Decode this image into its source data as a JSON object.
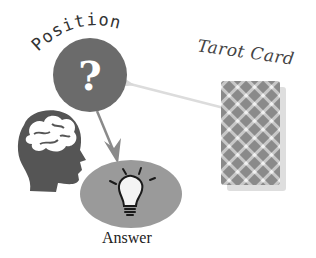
{
  "diagram": {
    "position_label": "Position",
    "position_symbol": "?",
    "tarot_label": "Tarot Card",
    "answer_label": "Answer",
    "icons": {
      "position": "question-circle-icon",
      "mind": "brain-head-icon",
      "answer": "lightbulb-icon",
      "card": "tarot-card-icon"
    },
    "colors": {
      "circle": "#6b6b6b",
      "ellipse": "#9a9a9a",
      "head": "#555555",
      "arrow_main": "#8a8a8a",
      "arrow_light": "#d5d5d5",
      "card": "#8c8c8c"
    }
  }
}
